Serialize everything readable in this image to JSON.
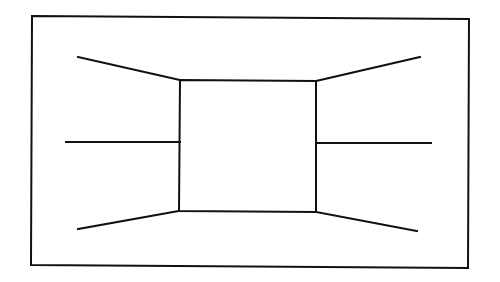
{
  "diagram": {
    "type": "one-point-perspective-room",
    "stroke_color": "#111111",
    "background_color": "#ffffff",
    "frame": {
      "points": [
        [
          32,
          16
        ],
        [
          469,
          19
        ],
        [
          468,
          268
        ],
        [
          31,
          265
        ]
      ]
    },
    "back_wall": {
      "points": [
        [
          180,
          80
        ],
        [
          316,
          81
        ],
        [
          316,
          212
        ],
        [
          179,
          211
        ]
      ]
    },
    "lines": [
      {
        "name": "upper-left-edge",
        "x1": 78,
        "y1": 57,
        "x2": 180,
        "y2": 80
      },
      {
        "name": "upper-right-edge",
        "x1": 316,
        "y1": 81,
        "x2": 420,
        "y2": 57
      },
      {
        "name": "middle-left-edge",
        "x1": 66,
        "y1": 142,
        "x2": 180,
        "y2": 142
      },
      {
        "name": "middle-right-edge",
        "x1": 316,
        "y1": 143,
        "x2": 431,
        "y2": 143
      },
      {
        "name": "lower-left-edge",
        "x1": 78,
        "y1": 229,
        "x2": 179,
        "y2": 211
      },
      {
        "name": "lower-right-edge",
        "x1": 316,
        "y1": 212,
        "x2": 417,
        "y2": 231
      }
    ]
  }
}
